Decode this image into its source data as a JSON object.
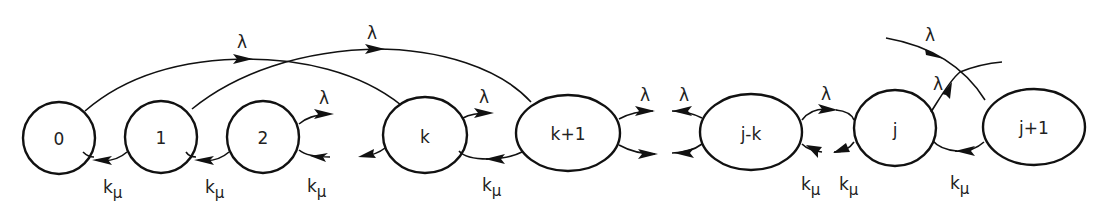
{
  "diagram": {
    "type": "state-transition",
    "title": "",
    "colors": {
      "stroke": "#111111",
      "text": "#222222",
      "background": "#ffffff"
    },
    "nodes": [
      {
        "id": "0",
        "label": "0"
      },
      {
        "id": "1",
        "label": "1"
      },
      {
        "id": "2",
        "label": "2"
      },
      {
        "id": "k",
        "label": "k"
      },
      {
        "id": "k+1",
        "label": "k+1"
      },
      {
        "id": "j-k",
        "label": "j-k"
      },
      {
        "id": "j",
        "label": "j"
      },
      {
        "id": "j+1",
        "label": "j+1"
      }
    ],
    "arrival_rate": "λ",
    "service_rate": {
      "main": "k",
      "sub": "μ"
    },
    "edges": [
      {
        "from": "0",
        "to": "k",
        "label": "λ",
        "kind": "arrival"
      },
      {
        "from": "1",
        "to": "k+1",
        "label": "λ",
        "kind": "arrival"
      },
      {
        "from": "2",
        "to": "…",
        "label": "λ",
        "kind": "arrival"
      },
      {
        "from": "k",
        "to": "…",
        "label": "λ",
        "kind": "arrival"
      },
      {
        "from": "k+1",
        "to": "…",
        "label": "λ",
        "kind": "arrival"
      },
      {
        "from": "…",
        "to": "j-k",
        "label": "λ",
        "kind": "arrival"
      },
      {
        "from": "j-k",
        "to": "j",
        "label": "λ",
        "kind": "arrival"
      },
      {
        "from": "j",
        "to": "…",
        "label": "λ",
        "kind": "arrival"
      },
      {
        "from": "…",
        "to": "j+1",
        "label": "λ",
        "kind": "arrival"
      },
      {
        "from": "1",
        "to": "0",
        "label": "kμ",
        "kind": "service"
      },
      {
        "from": "2",
        "to": "1",
        "label": "kμ",
        "kind": "service"
      },
      {
        "from": "…",
        "to": "2",
        "label": "kμ",
        "kind": "service"
      },
      {
        "from": "k",
        "to": "…",
        "label": "",
        "kind": "service"
      },
      {
        "from": "k+1",
        "to": "k",
        "label": "kμ",
        "kind": "service"
      },
      {
        "from": "k+1",
        "to": "…",
        "label": "",
        "kind": "service"
      },
      {
        "from": "j-k",
        "to": "…",
        "label": "",
        "kind": "service"
      },
      {
        "from": "…",
        "to": "j-k",
        "label": "kμ",
        "kind": "service"
      },
      {
        "from": "j",
        "to": "…",
        "label": "kμ",
        "kind": "service"
      },
      {
        "from": "j+1",
        "to": "j",
        "label": "kμ",
        "kind": "service"
      }
    ]
  }
}
